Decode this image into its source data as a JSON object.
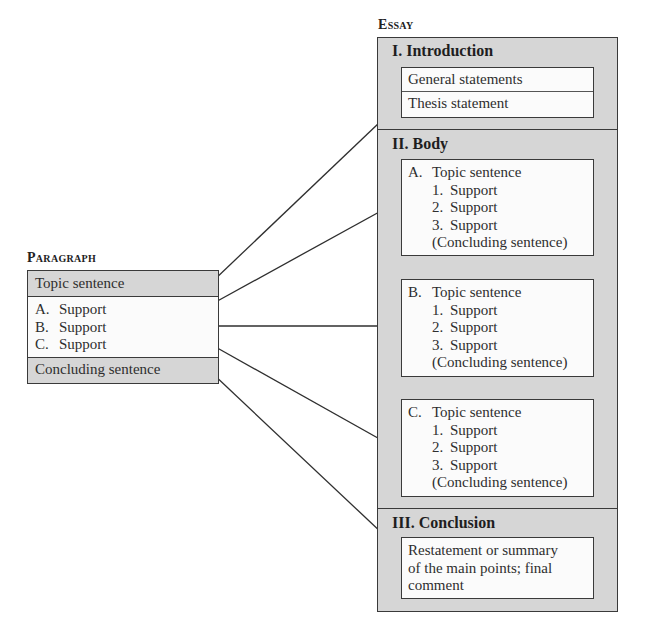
{
  "paragraph": {
    "heading": "Paragraph",
    "topic_sentence": "Topic sentence",
    "supports": [
      {
        "letter": "A.",
        "text": "Support"
      },
      {
        "letter": "B.",
        "text": "Support"
      },
      {
        "letter": "C.",
        "text": "Support"
      }
    ],
    "concluding_sentence": "Concluding sentence"
  },
  "essay": {
    "heading": "Essay",
    "introduction": {
      "title": "I. Introduction",
      "items": [
        "General statements",
        "Thesis statement"
      ]
    },
    "body": {
      "title": "II. Body",
      "paragraphs": [
        {
          "letter": "A.",
          "topic": "Topic sentence",
          "supports": [
            {
              "num": "1.",
              "text": "Support"
            },
            {
              "num": "2.",
              "text": "Support"
            },
            {
              "num": "3.",
              "text": "Support"
            }
          ],
          "concluding": "(Concluding sentence)"
        },
        {
          "letter": "B.",
          "topic": "Topic sentence",
          "supports": [
            {
              "num": "1.",
              "text": "Support"
            },
            {
              "num": "2.",
              "text": "Support"
            },
            {
              "num": "3.",
              "text": "Support"
            }
          ],
          "concluding": "(Concluding sentence)"
        },
        {
          "letter": "C.",
          "topic": "Topic sentence",
          "supports": [
            {
              "num": "1.",
              "text": "Support"
            },
            {
              "num": "2.",
              "text": "Support"
            },
            {
              "num": "3.",
              "text": "Support"
            }
          ],
          "concluding": "(Concluding sentence)"
        }
      ]
    },
    "conclusion": {
      "title": "III. Conclusion",
      "lines": [
        "Restatement or summary",
        "of the main points; final",
        "comment"
      ]
    }
  },
  "connectors": [
    {
      "from": "paragraph.topic_sentence",
      "to": "essay.introduction.thesis_statement"
    },
    {
      "from": "paragraph.support_A",
      "to": "essay.body.paragraph_A"
    },
    {
      "from": "paragraph.support_B",
      "to": "essay.body.paragraph_B"
    },
    {
      "from": "paragraph.support_C",
      "to": "essay.body.paragraph_C"
    },
    {
      "from": "paragraph.concluding_sentence",
      "to": "essay.conclusion"
    }
  ],
  "colors": {
    "section_fill": "#d6d6d6",
    "box_fill": "#fbfbfb",
    "border": "#3a3a3a",
    "text": "#2e2e2e"
  }
}
